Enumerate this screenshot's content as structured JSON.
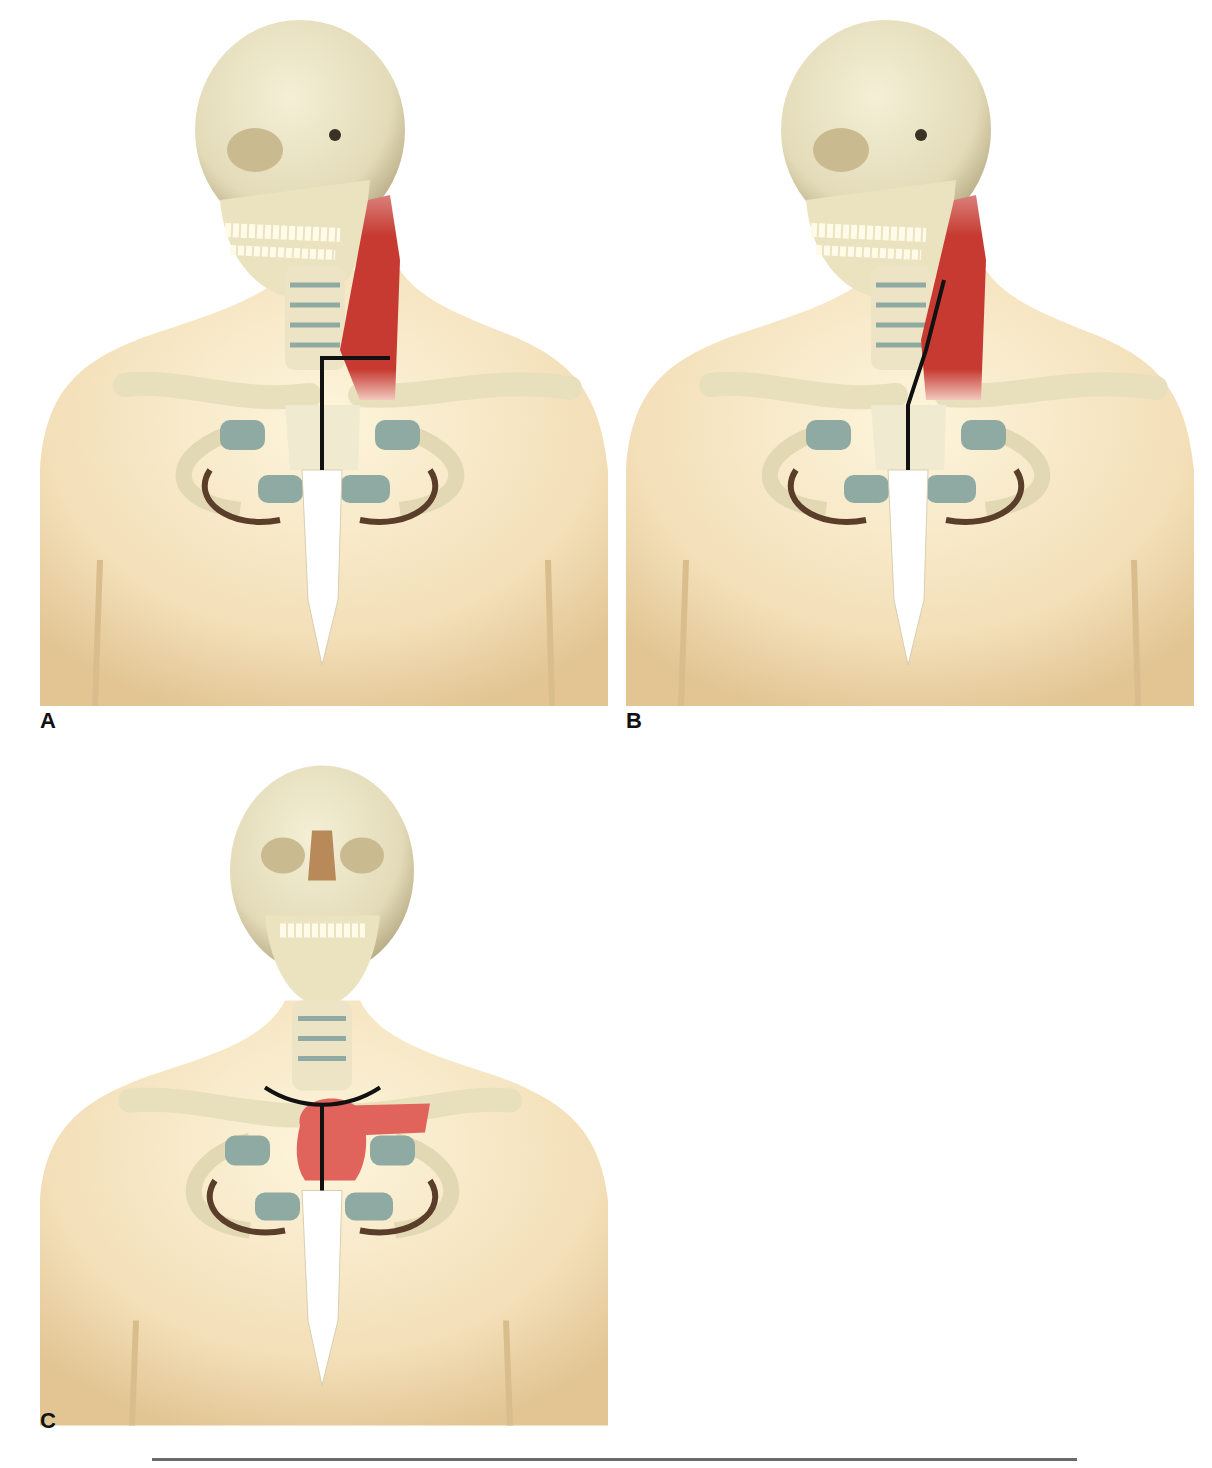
{
  "figure": {
    "panels": [
      {
        "label": "A",
        "view": "oblique",
        "incision": "L-shaped (vertical sternal + horizontal clavicular)",
        "highlight": "sternocleidomastoid muscle"
      },
      {
        "label": "B",
        "view": "oblique",
        "incision": "vertical sternal extended along anterior border of sternocleidomastoid",
        "highlight": "sternocleidomastoid muscle"
      },
      {
        "label": "C",
        "view": "frontal",
        "incision": "T-shaped (vertical sternal + curved transverse collar)",
        "highlight": "manubrium and medial clavicle"
      }
    ],
    "caption": ""
  },
  "colors": {
    "skin": "#f3dfb8",
    "bone": "#ece4c4",
    "cartilage": "#8fa9a3",
    "muscle": "#c0302a",
    "resection": "#e0645c",
    "incision": "#111111",
    "sternum": "#ffffff"
  }
}
